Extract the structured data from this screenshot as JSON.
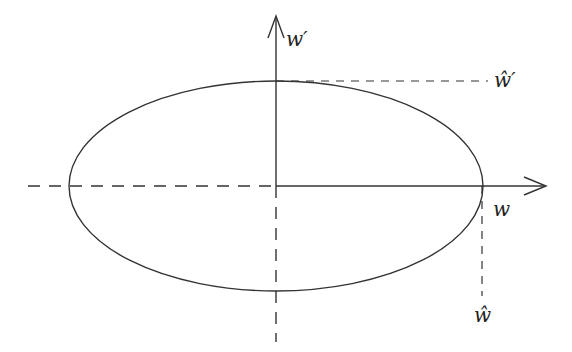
{
  "diagram": {
    "type": "ellipse-axes",
    "colors": {
      "stroke": "#333333",
      "background": "#ffffff"
    },
    "axes": {
      "horizontal": {
        "label": "w"
      },
      "vertical": {
        "label": "w′"
      }
    },
    "ellipse": {
      "cx": 276,
      "cy": 186,
      "rx": 207,
      "ry": 105
    },
    "markers": {
      "top_intercept": {
        "label": "ŵ′"
      },
      "right_intercept": {
        "label": "ŵ"
      }
    }
  }
}
